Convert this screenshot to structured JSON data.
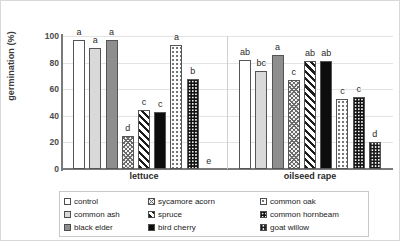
{
  "axis": {
    "ylabel": "germination (%)",
    "yticks": [
      "100",
      "80",
      "60",
      "40",
      "20",
      "0"
    ]
  },
  "groups": [
    {
      "label": "lettuce"
    },
    {
      "label": "oilseed rape"
    }
  ],
  "legend": [
    {
      "label": "control",
      "key": "control"
    },
    {
      "label": "sycamore acorn",
      "key": "sycamore"
    },
    {
      "label": "common oak",
      "key": "oak"
    },
    {
      "label": "common ash",
      "key": "ash"
    },
    {
      "label": "spruce",
      "key": "spruce"
    },
    {
      "label": "common hornbeam",
      "key": "hornbeam"
    },
    {
      "label": "black elder",
      "key": "elder"
    },
    {
      "label": "bird cherry",
      "key": "cherry"
    },
    {
      "label": "goat willow",
      "key": "willow"
    }
  ],
  "chart_data": {
    "type": "bar",
    "title": "",
    "xlabel": "",
    "ylabel": "germination (%)",
    "ylim": [
      0,
      100
    ],
    "ytick_step": 20,
    "grid": true,
    "legend_position": "bottom",
    "categories": [
      "lettuce",
      "oilseed rape"
    ],
    "series": [
      {
        "name": "control",
        "values": [
          97,
          82
        ],
        "labels": [
          "a",
          "ab"
        ]
      },
      {
        "name": "common ash",
        "values": [
          91,
          74
        ],
        "labels": [
          "a",
          "bc"
        ]
      },
      {
        "name": "black elder",
        "values": [
          97,
          86
        ],
        "labels": [
          "a",
          "a"
        ]
      },
      {
        "name": "sycamore acorn",
        "values": [
          25,
          67
        ],
        "labels": [
          "d",
          "c"
        ]
      },
      {
        "name": "spruce",
        "values": [
          44,
          81
        ],
        "labels": [
          "c",
          "ab"
        ]
      },
      {
        "name": "bird cherry",
        "values": [
          43,
          81
        ],
        "labels": [
          "c",
          "ab"
        ]
      },
      {
        "name": "common oak",
        "values": [
          93,
          53
        ],
        "labels": [
          "a",
          "c"
        ]
      },
      {
        "name": "common hornbeam",
        "values": [
          68,
          54
        ],
        "labels": [
          "b",
          "c"
        ]
      },
      {
        "name": "goat willow",
        "values": [
          0,
          20
        ],
        "labels": [
          "e",
          "d"
        ]
      }
    ]
  }
}
